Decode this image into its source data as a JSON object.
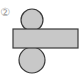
{
  "figure": {
    "label": "②",
    "colors": {
      "fill": "#c8c8c8",
      "stroke": "#3a3a3a",
      "label": "#9a9a9a"
    },
    "shapes": {
      "top_circle": {
        "cx": 32,
        "cy": 20,
        "r": 11
      },
      "rectangle": {
        "x": 13,
        "y": 29,
        "width": 65,
        "height": 19
      },
      "bottom_circle": {
        "cx": 32,
        "cy": 60,
        "r": 13
      }
    }
  }
}
